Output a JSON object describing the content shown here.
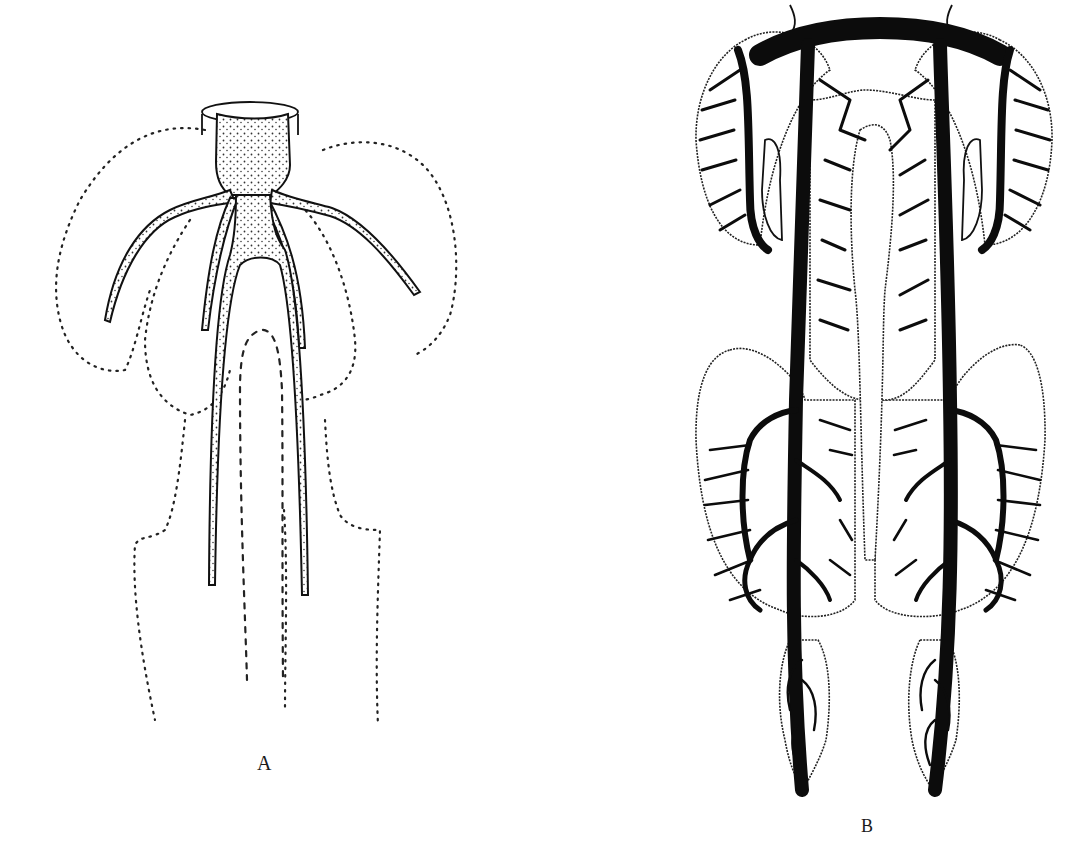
{
  "figures": [
    {
      "id": "A",
      "label": "A"
    },
    {
      "id": "B",
      "label": "B"
    }
  ],
  "colors": {
    "ink": "#111111",
    "background": "#ffffff"
  }
}
